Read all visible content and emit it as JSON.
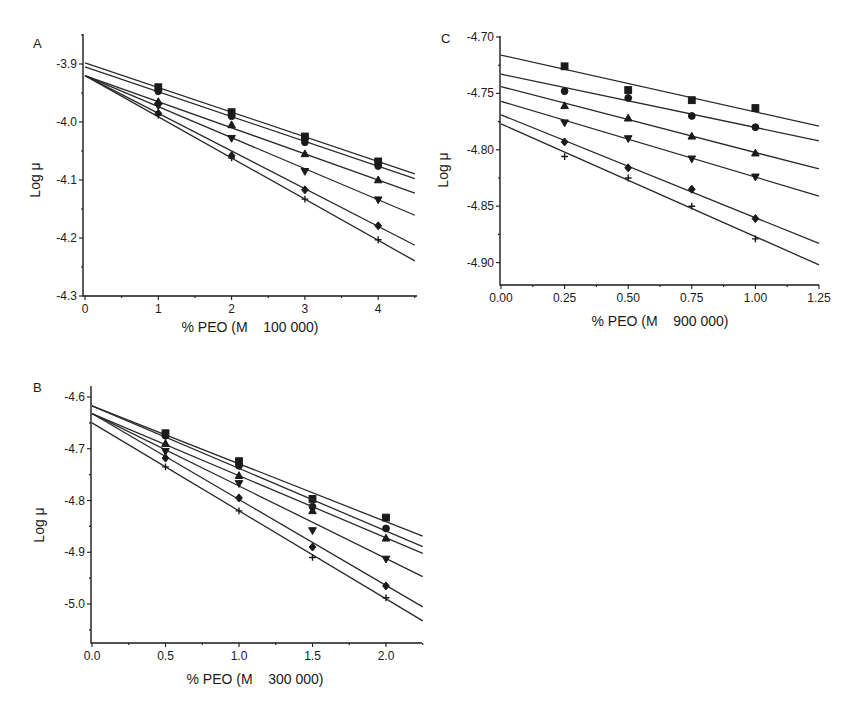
{
  "figure": {
    "panels": [
      "A",
      "B",
      "C"
    ]
  },
  "chart_data": [
    {
      "panel": "A",
      "type": "scatter",
      "title": "",
      "xlabel": "% PEO (M    100 000)",
      "ylabel": "Log μ",
      "xlim": [
        0,
        4.5
      ],
      "ylim": [
        -4.3,
        -3.85
      ],
      "xticks": [
        0,
        1,
        2,
        3,
        4
      ],
      "xtick_labels": [
        "0",
        "1",
        "2",
        "3",
        "4"
      ],
      "yticks": [
        -3.9,
        -4.0,
        -4.1,
        -4.2,
        -4.3
      ],
      "ytick_labels": [
        "-3.9",
        "-4.0",
        "-4.1",
        "-4.2",
        "-4.3"
      ],
      "grid": false,
      "legend": "none",
      "x": [
        1,
        2,
        3,
        4
      ],
      "series": [
        {
          "name": "square",
          "marker": "square",
          "values": [
            -3.94,
            -3.983,
            -4.025,
            -4.068
          ],
          "fit": {
            "intercept": -3.898,
            "slope": -0.0425
          }
        },
        {
          "name": "circle",
          "marker": "circle",
          "values": [
            -3.947,
            -3.99,
            -4.035,
            -4.076
          ],
          "fit": {
            "intercept": -3.905,
            "slope": -0.0428
          }
        },
        {
          "name": "triangle-up",
          "marker": "triangle-up",
          "values": [
            -3.965,
            -4.005,
            -4.055,
            -4.1
          ],
          "fit": {
            "intercept": -3.92,
            "slope": -0.045
          }
        },
        {
          "name": "triangle-down",
          "marker": "triangle-down",
          "values": [
            -3.972,
            -4.028,
            -4.085,
            -4.134
          ],
          "fit": {
            "intercept": -3.92,
            "slope": -0.0535
          }
        },
        {
          "name": "diamond",
          "marker": "diamond",
          "values": [
            -3.985,
            -4.058,
            -4.117,
            -4.179
          ],
          "fit": {
            "intercept": -3.92,
            "slope": -0.065
          }
        },
        {
          "name": "plus",
          "marker": "plus",
          "values": [
            -3.988,
            -4.062,
            -4.133,
            -4.203
          ],
          "fit": {
            "intercept": -3.92,
            "slope": -0.071
          }
        }
      ]
    },
    {
      "panel": "B",
      "type": "scatter",
      "title": "",
      "xlabel": "% PEO (M    300 000)",
      "ylabel": "Log μ",
      "xlim": [
        0,
        2.25
      ],
      "ylim": [
        -5.075,
        -4.575
      ],
      "xticks": [
        0,
        0.5,
        1.0,
        1.5,
        2.0
      ],
      "xtick_labels": [
        "0.0",
        "0.5",
        "1.0",
        "1.5",
        "2.0"
      ],
      "yticks": [
        -4.6,
        -4.7,
        -4.8,
        -4.9,
        -5.0
      ],
      "ytick_labels": [
        "-4.6",
        "-4.7",
        "-4.8",
        "-4.9",
        "-5.0"
      ],
      "grid": false,
      "legend": "none",
      "x": [
        0.5,
        1.0,
        1.5,
        2.0
      ],
      "series": [
        {
          "name": "square",
          "marker": "square",
          "values": [
            -4.67,
            -4.724,
            -4.797,
            -4.833
          ],
          "fit": {
            "intercept": -4.617,
            "slope": -0.112
          }
        },
        {
          "name": "circle",
          "marker": "circle",
          "values": [
            -4.675,
            -4.733,
            -4.812,
            -4.854
          ],
          "fit": {
            "intercept": -4.617,
            "slope": -0.121
          }
        },
        {
          "name": "triangle-up",
          "marker": "triangle-up",
          "values": [
            -4.69,
            -4.752,
            -4.82,
            -4.873
          ],
          "fit": {
            "intercept": -4.632,
            "slope": -0.12
          }
        },
        {
          "name": "triangle-down",
          "marker": "triangle-down",
          "values": [
            -4.705,
            -4.767,
            -4.858,
            -4.913
          ],
          "fit": {
            "intercept": -4.632,
            "slope": -0.14
          }
        },
        {
          "name": "diamond",
          "marker": "diamond",
          "values": [
            -4.718,
            -4.795,
            -4.89,
            -4.965
          ],
          "fit": {
            "intercept": -4.632,
            "slope": -0.166
          }
        },
        {
          "name": "plus",
          "marker": "plus",
          "values": [
            -4.735,
            -4.82,
            -4.91,
            -4.988
          ],
          "fit": {
            "intercept": -4.65,
            "slope": -0.17
          }
        }
      ]
    },
    {
      "panel": "C",
      "type": "scatter",
      "title": "",
      "xlabel": "% PEO (M    900 000)",
      "ylabel": "Log μ",
      "xlim": [
        0,
        1.25
      ],
      "ylim": [
        -4.92,
        -4.7
      ],
      "xticks": [
        0,
        0.25,
        0.5,
        0.75,
        1.0,
        1.25
      ],
      "xtick_labels": [
        "0.00",
        "0.25",
        "0.50",
        "0.75",
        "1.00",
        "1.25"
      ],
      "yticks": [
        -4.7,
        -4.75,
        -4.8,
        -4.85,
        -4.9
      ],
      "ytick_labels": [
        "-4.70",
        "-4.75",
        "-4.80",
        "-4.85",
        "-4.90"
      ],
      "grid": false,
      "legend": "none",
      "x": [
        0.25,
        0.5,
        0.75,
        1.0
      ],
      "series": [
        {
          "name": "square",
          "marker": "square",
          "values": [
            -4.726,
            -4.747,
            -4.756,
            -4.763
          ],
          "fit": {
            "intercept": -4.716,
            "slope": -0.0504
          }
        },
        {
          "name": "circle",
          "marker": "circle",
          "values": [
            -4.748,
            -4.754,
            -4.77,
            -4.78
          ],
          "fit": {
            "intercept": -4.733,
            "slope": -0.0472
          }
        },
        {
          "name": "triangle-up",
          "marker": "triangle-up",
          "values": [
            -4.761,
            -4.772,
            -4.788,
            -4.803
          ],
          "fit": {
            "intercept": -4.744,
            "slope": -0.0584
          }
        },
        {
          "name": "triangle-down",
          "marker": "triangle-down",
          "values": [
            -4.776,
            -4.79,
            -4.808,
            -4.824
          ],
          "fit": {
            "intercept": -4.757,
            "slope": -0.0672
          }
        },
        {
          "name": "diamond",
          "marker": "diamond",
          "values": [
            -4.793,
            -4.816,
            -4.835,
            -4.861
          ],
          "fit": {
            "intercept": -4.769,
            "slope": -0.0912
          }
        },
        {
          "name": "plus",
          "marker": "plus",
          "values": [
            -4.806,
            -4.825,
            -4.85,
            -4.879
          ],
          "fit": {
            "intercept": -4.777,
            "slope": -0.1
          }
        }
      ]
    }
  ],
  "layout": {
    "A": {
      "x0": 85,
      "xPerUnit": 73.3,
      "yAxisX": 83,
      "yTop": 34,
      "y0val": -3.9,
      "y0px": 64,
      "yPerUnit": 580,
      "xAxisY": 296,
      "xEndPx": 417,
      "labelX": 33,
      "labelY": 48,
      "ylabelX": 40,
      "ylabelY": 180,
      "xlabelX": 250,
      "xlabelY": 332
    },
    "B": {
      "x0": 92,
      "xPerUnit": 147,
      "yAxisX": 91,
      "yTop": 386,
      "y0val": -4.6,
      "y0px": 397,
      "yPerUnit": 517.5,
      "xAxisY": 643,
      "xEndPx": 422,
      "labelX": 33,
      "labelY": 392,
      "ylabelX": 44,
      "ylabelY": 525,
      "xlabelX": 255,
      "xlabelY": 684
    },
    "C": {
      "x0": 501,
      "xPerUnit": 254.4,
      "yAxisX": 500,
      "yTop": 36,
      "y0val": -4.7,
      "y0px": 37,
      "yPerUnit": 1128,
      "xAxisY": 285,
      "xEndPx": 819,
      "labelX": 441,
      "labelY": 43,
      "ylabelX": 448,
      "ylabelY": 170,
      "xlabelX": 660,
      "xlabelY": 326
    }
  }
}
